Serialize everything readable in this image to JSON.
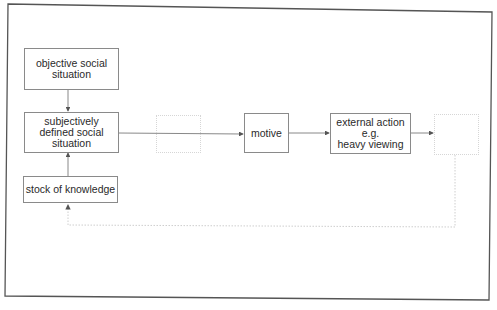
{
  "diagram": {
    "type": "flowchart",
    "nodes": [
      {
        "id": "objective",
        "label": "objective social\nsituation"
      },
      {
        "id": "subjective",
        "label": "subjectively\ndefined social\nsituation"
      },
      {
        "id": "stock",
        "label": "stock of knowledge"
      },
      {
        "id": "blank1",
        "label": ""
      },
      {
        "id": "motive",
        "label": "motive"
      },
      {
        "id": "action",
        "label": "external action\ne.g.\nheavy viewing"
      },
      {
        "id": "blank2",
        "label": ""
      }
    ],
    "edges": [
      {
        "from": "objective",
        "to": "subjective",
        "style": "solid"
      },
      {
        "from": "stock",
        "to": "subjective",
        "style": "solid"
      },
      {
        "from": "subjective",
        "to": "motive",
        "style": "solid",
        "via": "blank1"
      },
      {
        "from": "motive",
        "to": "action",
        "style": "solid"
      },
      {
        "from": "action",
        "to": "blank2",
        "style": "solid"
      },
      {
        "from": "blank2",
        "to": "stock",
        "style": "dotted",
        "route": "feedback loop below"
      }
    ],
    "colors": {
      "line": "#6a6a6a",
      "box_border": "#8a8a8a",
      "ghost": "#d6d6d6",
      "frame": "#555555"
    }
  }
}
